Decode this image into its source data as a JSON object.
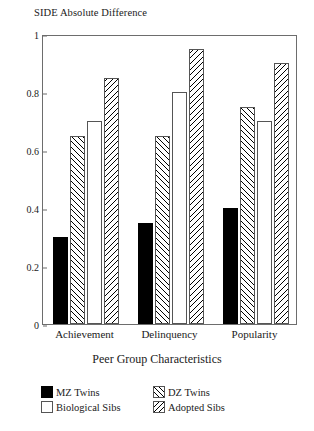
{
  "chart_data": {
    "type": "bar",
    "title": "SIDE Absolute Difference",
    "xlabel": "Peer Group Characteristics",
    "ylabel": "",
    "ylim": [
      0,
      1
    ],
    "yticks": [
      "0",
      "0.2",
      "0.4",
      "0.6",
      "0.8",
      "1"
    ],
    "ytick_values": [
      0,
      0.2,
      0.4,
      0.6,
      0.8,
      1
    ],
    "grid": false,
    "legend_position": "bottom",
    "categories": [
      "Achievement",
      "Delinquency",
      "Popularity"
    ],
    "series": [
      {
        "name": "MZ Twins",
        "pattern": "solid-black",
        "values": [
          0.3,
          0.35,
          0.4
        ]
      },
      {
        "name": "DZ Twins",
        "pattern": "hatch-fwd",
        "values": [
          0.65,
          0.65,
          0.75
        ]
      },
      {
        "name": "Biological Sibs",
        "pattern": "empty-white",
        "values": [
          0.7,
          0.8,
          0.7
        ]
      },
      {
        "name": "Adopted Sibs",
        "pattern": "hatch-bwd",
        "values": [
          0.85,
          0.95,
          0.9
        ]
      }
    ]
  }
}
